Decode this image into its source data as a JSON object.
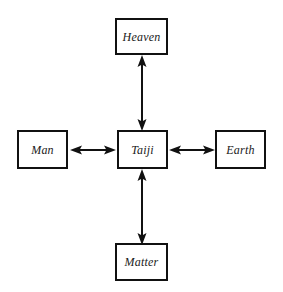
{
  "diagram": {
    "background_color": "#ffffff",
    "line_color": "#111111",
    "text_color": "#1a1a1a",
    "nodes": [
      {
        "id": "heaven",
        "label": "Heaven",
        "position": "top"
      },
      {
        "id": "taiji",
        "label": "Taiji",
        "position": "center"
      },
      {
        "id": "man",
        "label": "Man",
        "position": "left"
      },
      {
        "id": "earth",
        "label": "Earth",
        "position": "right"
      },
      {
        "id": "matter",
        "label": "Matter",
        "position": "bottom"
      }
    ],
    "connectors": [
      {
        "id": "taiji-heaven",
        "from": "Taiji",
        "to": "Heaven",
        "style": "double-headed-arrow",
        "orientation": "vertical"
      },
      {
        "id": "taiji-matter",
        "from": "Taiji",
        "to": "Matter",
        "style": "double-headed-arrow",
        "orientation": "vertical"
      },
      {
        "id": "man-taiji",
        "from": "Man",
        "to": "Taiji",
        "style": "double-headed-arrow",
        "orientation": "horizontal"
      },
      {
        "id": "taiji-earth",
        "from": "Taiji",
        "to": "Earth",
        "style": "double-headed-arrow",
        "orientation": "horizontal"
      }
    ]
  }
}
